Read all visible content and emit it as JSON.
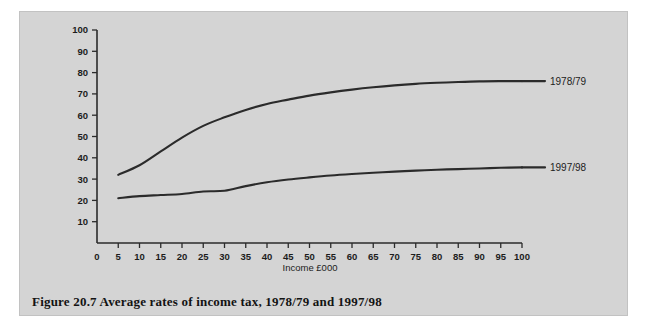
{
  "figure": {
    "caption": "Figure 20.7  Average rates of income tax, 1978/79 and 1997/98",
    "panel_background": "#d4d4d4",
    "page_background": "#ffffff",
    "line_color": "#2b2b2b"
  },
  "chart_data": {
    "type": "line",
    "title": "",
    "subtitle": "",
    "xlabel": "Income £000",
    "ylabel": "",
    "xlim": [
      0,
      100
    ],
    "ylim": [
      0,
      100
    ],
    "grid": false,
    "legend_position": "right-inline",
    "xticks": [
      0,
      5,
      10,
      15,
      20,
      25,
      30,
      35,
      40,
      45,
      50,
      55,
      60,
      65,
      70,
      75,
      80,
      85,
      90,
      95,
      100
    ],
    "xtick_labels": [
      "0",
      "5",
      "10",
      "15",
      "20",
      "25",
      "30",
      "35",
      "40",
      "45",
      "50",
      "55",
      "60",
      "65",
      "70",
      "75",
      "80",
      "85",
      "90",
      "95",
      "100"
    ],
    "yticks": [
      10,
      20,
      30,
      40,
      50,
      60,
      70,
      80,
      90,
      100
    ],
    "ytick_labels": [
      "10",
      "20",
      "30",
      "40",
      "50",
      "60",
      "70",
      "80",
      "90",
      "100"
    ],
    "x": [
      5,
      10,
      15,
      20,
      25,
      30,
      35,
      40,
      45,
      50,
      55,
      60,
      65,
      70,
      75,
      80,
      85,
      90,
      95,
      100
    ],
    "series": [
      {
        "name": "1978/79",
        "label": "1978/79",
        "color": "#2b2b2b",
        "values": [
          32,
          36.5,
          43,
          49.5,
          55,
          59,
          62.5,
          65.3,
          67.3,
          69.2,
          70.7,
          72,
          73.1,
          74,
          74.7,
          75.2,
          75.6,
          75.9,
          76,
          76
        ]
      },
      {
        "name": "1997/98",
        "label": "1997/98",
        "color": "#2b2b2b",
        "values": [
          21,
          22,
          22.5,
          23,
          24.2,
          24.5,
          26.7,
          28.5,
          29.8,
          30.8,
          31.7,
          32.4,
          33,
          33.5,
          34,
          34.4,
          34.7,
          35,
          35.3,
          35.5
        ]
      }
    ]
  }
}
